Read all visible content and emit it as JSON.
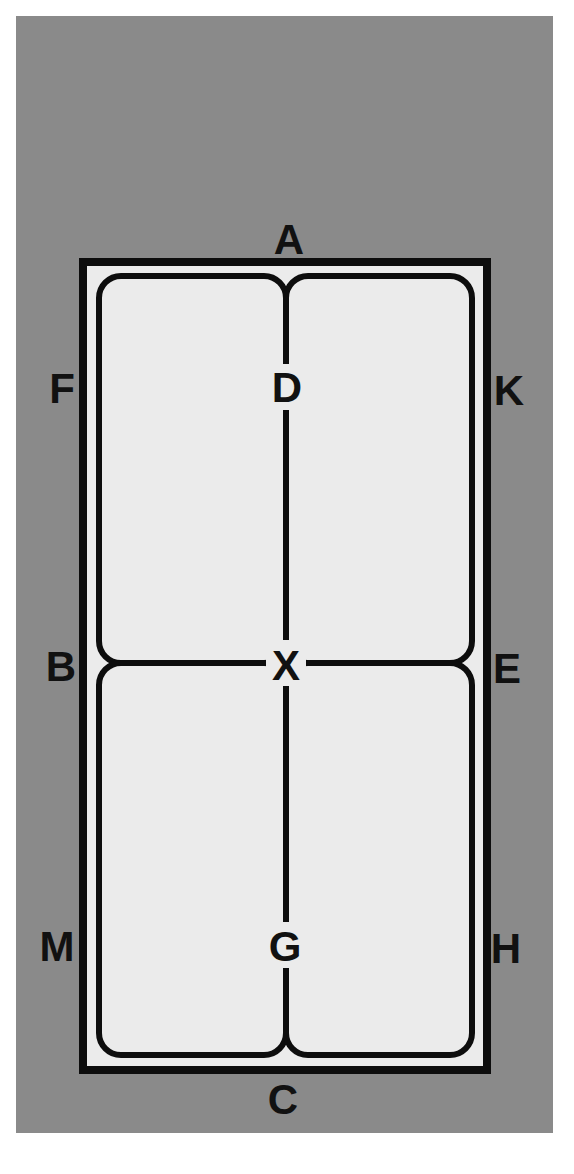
{
  "diagram": {
    "type": "dressage-arena",
    "colors": {
      "background": "#8a8a8a",
      "arena_fill": "#ebebeb",
      "lines": "#0d0d0d",
      "page": "#ffffff"
    },
    "outer_markers": {
      "top": "A",
      "bottom": "C",
      "left_upper": "F",
      "left_middle": "B",
      "left_lower": "M",
      "right_upper": "K",
      "right_middle": "E",
      "right_lower": "H"
    },
    "centerline_markers": {
      "upper": "D",
      "center": "X",
      "lower": "G"
    }
  }
}
